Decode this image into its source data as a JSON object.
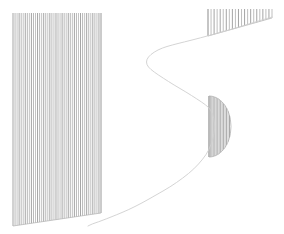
{
  "figure": {
    "title": "",
    "width": 284,
    "height": 234,
    "background_color": "#ffffff"
  },
  "style": {
    "hatch_color": "#9a9a9a",
    "hatch_width": 0.8,
    "curve_color": "#cfcfcf",
    "curve_width": 0.9,
    "boundary_color": "#b0b0b0",
    "boundary_width": 0.7
  },
  "chart_data": {
    "type": "area",
    "title": "",
    "xlabel": "",
    "ylabel": "",
    "xlim": [
      0,
      284
    ],
    "ylim": [
      0,
      234
    ],
    "grid": false,
    "legend": "none",
    "annotations": [],
    "tick_labels": {
      "x": [],
      "y": []
    },
    "curve": {
      "name": "boundary-curve",
      "description": "sideways S boundary sweeping from upper-right, left to a cusp, then right and down to lower-left",
      "color": "#cfcfcf",
      "points": [
        [
          272,
          17
        ],
        [
          255,
          22
        ],
        [
          236,
          28
        ],
        [
          218,
          33
        ],
        [
          200,
          38
        ],
        [
          184,
          42
        ],
        [
          172,
          45
        ],
        [
          162,
          48
        ],
        [
          154,
          52
        ],
        [
          148,
          57
        ],
        [
          146,
          62
        ],
        [
          148,
          67
        ],
        [
          154,
          72
        ],
        [
          163,
          78
        ],
        [
          174,
          85
        ],
        [
          186,
          92
        ],
        [
          197,
          99
        ],
        [
          206,
          105
        ],
        [
          211,
          110
        ],
        [
          214,
          118
        ],
        [
          215,
          128
        ],
        [
          213,
          139
        ],
        [
          209,
          150
        ],
        [
          203,
          159
        ],
        [
          194,
          169
        ],
        [
          183,
          178
        ],
        [
          170,
          187
        ],
        [
          156,
          195
        ],
        [
          142,
          203
        ],
        [
          128,
          210
        ],
        [
          116,
          215
        ],
        [
          106,
          219
        ],
        [
          98,
          222
        ],
        [
          92,
          224
        ],
        [
          88,
          226
        ]
      ]
    },
    "regions": [
      {
        "name": "left-hatched-block",
        "hatch": "vertical",
        "x_start": 13,
        "x_end": 101,
        "y_top": 13,
        "y_bottom_left": 226,
        "y_bottom_right": 213,
        "line_count": 44,
        "color": "#9a9a9a"
      },
      {
        "name": "top-right-hatched-block",
        "hatch": "vertical",
        "x_start": 208,
        "x_end": 272,
        "y_top": 9,
        "y_bottom_left": 36,
        "y_bottom_right": 18,
        "line_count": 22,
        "color": "#9a9a9a"
      },
      {
        "name": "lens-hatched-region",
        "hatch": "vertical",
        "x_start": 209,
        "x_end": 231,
        "y_top": 96,
        "y_bottom": 157,
        "shape": "half-lens",
        "line_count": 16,
        "color": "#9a9a9a"
      }
    ]
  }
}
